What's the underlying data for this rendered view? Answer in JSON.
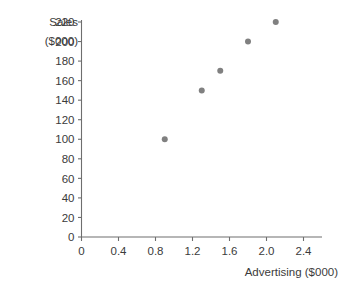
{
  "chart_data": {
    "type": "scatter",
    "title": "",
    "xlabel": "Advertising ($000)",
    "ylabel_line1": "Sales",
    "ylabel_line2": "($000)",
    "ylabel": "Sales ($000)",
    "x": [
      0.9,
      1.3,
      1.5,
      1.8,
      2.1
    ],
    "values": [
      100,
      150,
      170,
      200,
      220
    ],
    "points": [
      {
        "x": 0.9,
        "y": 100
      },
      {
        "x": 1.3,
        "y": 150
      },
      {
        "x": 1.5,
        "y": 170
      },
      {
        "x": 1.8,
        "y": 200
      },
      {
        "x": 2.1,
        "y": 220
      }
    ],
    "xlim": [
      0,
      2.6
    ],
    "ylim": [
      0,
      220
    ],
    "xticks": [
      0,
      0.4,
      0.8,
      1.2,
      1.6,
      2.0,
      2.4
    ],
    "xtick_labels": [
      "0",
      "0.4",
      "0.8",
      "1.2",
      "1.6",
      "2.0",
      "2.4"
    ],
    "yticks": [
      0,
      20,
      40,
      60,
      80,
      100,
      120,
      140,
      160,
      180,
      200,
      220
    ],
    "ytick_labels": [
      "0",
      "20",
      "40",
      "60",
      "80",
      "100",
      "120",
      "140",
      "160",
      "180",
      "200",
      "220"
    ],
    "grid": false,
    "legend": null,
    "marker_color": "#808080",
    "marker_size": 6,
    "axis_color": "#6e6e6e"
  }
}
